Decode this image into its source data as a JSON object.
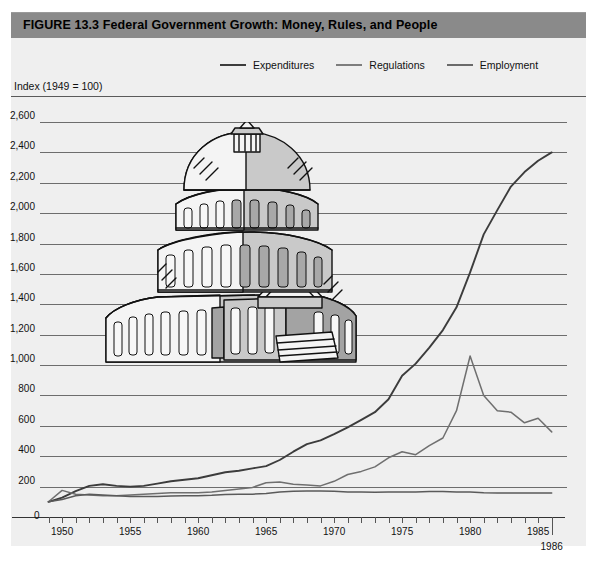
{
  "figure": {
    "title": "FIGURE 13.3  Federal Government Growth: Money, Rules, and People",
    "title_bar_color": "#8a8a8a",
    "panel_color": "#efefef"
  },
  "axis_title": "Index (1949 = 100)",
  "legend": [
    {
      "label": "Expenditures",
      "color": "#3c3c3c"
    },
    {
      "label": "Regulations",
      "color": "#6f6f6f"
    },
    {
      "label": "Employment",
      "color": "#5a5a5a"
    }
  ],
  "illustration": {
    "name": "us-capitol-building",
    "caption": ""
  },
  "chart_data": {
    "type": "line",
    "title": "Federal Government Growth: Money, Rules, and People",
    "subtitle": "",
    "xlabel": "",
    "ylabel": "Index (1949 = 100)",
    "xlim": [
      1949,
      1986
    ],
    "ylim": [
      0,
      2700
    ],
    "grid": true,
    "legend_position": "top-center",
    "ytick_labels": [
      "2,600",
      "2,400",
      "2,200",
      "2,000",
      "1,800",
      "1,600",
      "1,400",
      "1,200",
      "1,000",
      "800",
      "600",
      "400",
      "200",
      "0"
    ],
    "ytick_values": [
      2600,
      2400,
      2200,
      2000,
      1800,
      1600,
      1400,
      1200,
      1000,
      800,
      600,
      400,
      200,
      0
    ],
    "xtick_labels": [
      "1950",
      "1955",
      "1960",
      "1965",
      "1970",
      "1975",
      "1980",
      "1985"
    ],
    "xtick_values": [
      1950,
      1955,
      1960,
      1965,
      1970,
      1975,
      1980,
      1985
    ],
    "x_end_label": "1986",
    "x": [
      1949,
      1950,
      1951,
      1952,
      1953,
      1954,
      1955,
      1956,
      1957,
      1958,
      1959,
      1960,
      1961,
      1962,
      1963,
      1964,
      1965,
      1966,
      1967,
      1968,
      1969,
      1970,
      1971,
      1972,
      1973,
      1974,
      1975,
      1976,
      1977,
      1978,
      1979,
      1980,
      1981,
      1982,
      1983,
      1984,
      1985,
      1986
    ],
    "series": [
      {
        "name": "Expenditures",
        "color": "#3c3c3c",
        "values": [
          100,
          128,
          170,
          205,
          215,
          205,
          200,
          205,
          220,
          235,
          245,
          255,
          275,
          295,
          305,
          320,
          335,
          375,
          430,
          480,
          505,
          545,
          590,
          640,
          690,
          775,
          930,
          1010,
          1115,
          1230,
          1380,
          1610,
          1860,
          2020,
          2175,
          2270,
          2345,
          2400
        ]
      },
      {
        "name": "Regulations",
        "color": "#6f6f6f",
        "values": [
          100,
          175,
          150,
          145,
          140,
          140,
          145,
          150,
          155,
          160,
          160,
          160,
          165,
          175,
          185,
          195,
          225,
          230,
          215,
          210,
          205,
          235,
          280,
          300,
          330,
          390,
          430,
          410,
          470,
          520,
          700,
          1060,
          800,
          700,
          690,
          620,
          650,
          560
        ]
      },
      {
        "name": "Employment",
        "color": "#5a5a5a",
        "values": [
          100,
          115,
          140,
          150,
          145,
          140,
          135,
          135,
          135,
          138,
          140,
          140,
          143,
          148,
          150,
          150,
          155,
          165,
          170,
          172,
          172,
          170,
          165,
          165,
          163,
          165,
          165,
          165,
          168,
          168,
          165,
          165,
          160,
          158,
          158,
          158,
          158,
          158
        ]
      }
    ]
  }
}
